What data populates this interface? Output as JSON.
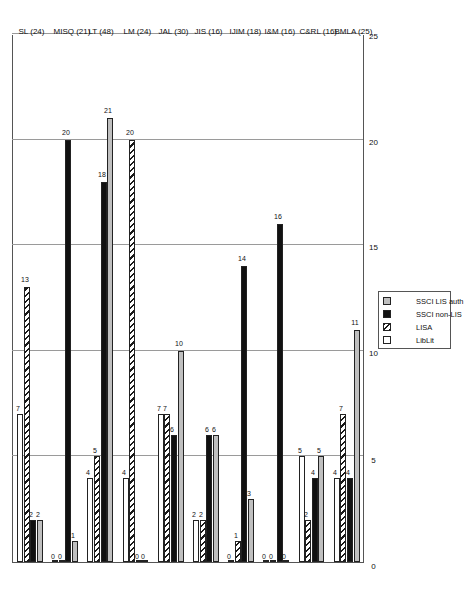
{
  "chart_data": {
    "type": "bar",
    "orientation": "horizontal",
    "title": "",
    "xlabel": "",
    "ylabel": "",
    "xlim": [
      0,
      25
    ],
    "xticks": [
      0,
      5,
      10,
      15,
      20,
      25
    ],
    "grid": true,
    "legend_position": "bottom-right",
    "categories": [
      "BMLA (25)",
      "C&RL (16)",
      "I&M (16)",
      "IJIM (18)",
      "JIS (16)",
      "JAL (30)",
      "LM (24)",
      "LT (48)",
      "MISQ (21)",
      "SL (24)"
    ],
    "series": [
      {
        "name": "LibLit",
        "values": [
          4,
          5,
          0,
          0,
          2,
          7,
          4,
          4,
          0,
          7
        ]
      },
      {
        "name": "LISA",
        "values": [
          7,
          2,
          0,
          1,
          2,
          7,
          20,
          5,
          0,
          13
        ]
      },
      {
        "name": "SSCI non-LIS",
        "values": [
          4,
          4,
          16,
          14,
          6,
          6,
          0,
          18,
          20,
          2
        ]
      },
      {
        "name": "SSCI LIS auth",
        "values": [
          11,
          5,
          0,
          3,
          6,
          10,
          0,
          21,
          1,
          2
        ]
      }
    ]
  },
  "axis": {
    "tick_labels": [
      "0",
      "5",
      "10",
      "15",
      "20",
      "25"
    ]
  },
  "legend": {
    "items": [
      {
        "label": "LibLit",
        "swatch": "open-square-swatch"
      },
      {
        "label": "LISA",
        "swatch": "hatched-square-swatch"
      },
      {
        "label": "SSCI non-LIS",
        "swatch": "black-square-swatch"
      },
      {
        "label": "SSCI LIS auth",
        "swatch": "gray-square-swatch"
      }
    ]
  },
  "colors": {
    "lib_lit": "#ffffff",
    "lisa": "#1a1a1a",
    "ssci_non_lis": "#111111",
    "ssci_lis_auth": "#bfbfbf",
    "grid": "#9a9a9a",
    "axis": "#555555"
  }
}
